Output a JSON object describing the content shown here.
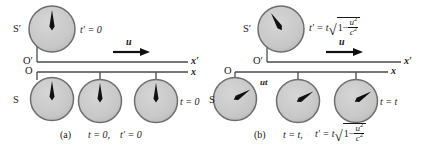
{
  "figure": {
    "type": "physics-diagram",
    "topic": "Time dilation: moving frame S' relative to rest frame S",
    "colors": {
      "clock_face": "#c9c9c9",
      "clock_border": "#6e6e6e",
      "hand": "#111111",
      "axis": "#4a4a4a",
      "text": "#1a1a1a",
      "background": "#ffffff"
    }
  },
  "panels": [
    {
      "id": "a",
      "caption_letter": "(a)",
      "caption_eq1": "t = 0,",
      "caption_eq2": "t′ = 0",
      "moving_frame_label": "S′",
      "rest_frame_label": "S",
      "moving_origin_label": "O′",
      "rest_origin_label": "O",
      "moving_axis_label": "x′",
      "rest_axis_label": "x",
      "velocity_label": "u",
      "moving_clock": {
        "reading_label": "t′ = 0",
        "hand_angle_deg": 0
      },
      "rest_clocks": {
        "reading_label": "t = 0",
        "hand_angle_deg": 0,
        "count": 3
      },
      "separation_label": ""
    },
    {
      "id": "b",
      "caption_letter": "(b)",
      "caption_eq1": "t = t,",
      "caption_eq2_lead": "t′ = t",
      "caption_radicand_lead": "1−",
      "caption_frac_num": "u",
      "caption_frac_den": "c",
      "caption_exp": "2",
      "moving_frame_label": "S′",
      "rest_frame_label": "S",
      "moving_origin_label": "O′",
      "rest_origin_label": "O",
      "moving_axis_label": "x′",
      "rest_axis_label": "x",
      "velocity_label": "u",
      "displacement_label": "ut",
      "moving_clock": {
        "reading_lead": "t′ = t",
        "reading_radicand_lead": "1−",
        "reading_frac_num": "u",
        "reading_frac_den": "c",
        "reading_exp": "2",
        "hand_angle_deg": -32
      },
      "rest_clocks": {
        "reading_label": "t = t",
        "hand_angle_deg": 58,
        "count": 3
      }
    }
  ]
}
